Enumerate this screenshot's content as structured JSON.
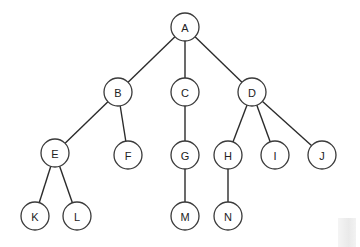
{
  "diagram": {
    "type": "tree",
    "root": "A",
    "nodes": [
      {
        "id": "A",
        "label": "A"
      },
      {
        "id": "B",
        "label": "B"
      },
      {
        "id": "C",
        "label": "C"
      },
      {
        "id": "D",
        "label": "D"
      },
      {
        "id": "E",
        "label": "E"
      },
      {
        "id": "F",
        "label": "F"
      },
      {
        "id": "G",
        "label": "G"
      },
      {
        "id": "H",
        "label": "H"
      },
      {
        "id": "I",
        "label": "I"
      },
      {
        "id": "J",
        "label": "J"
      },
      {
        "id": "K",
        "label": "K"
      },
      {
        "id": "L",
        "label": "L"
      },
      {
        "id": "M",
        "label": "M"
      },
      {
        "id": "N",
        "label": "N"
      }
    ],
    "edges": [
      [
        "A",
        "B"
      ],
      [
        "A",
        "C"
      ],
      [
        "A",
        "D"
      ],
      [
        "B",
        "E"
      ],
      [
        "B",
        "F"
      ],
      [
        "C",
        "G"
      ],
      [
        "D",
        "H"
      ],
      [
        "D",
        "I"
      ],
      [
        "D",
        "J"
      ],
      [
        "E",
        "K"
      ],
      [
        "E",
        "L"
      ],
      [
        "G",
        "M"
      ],
      [
        "H",
        "N"
      ]
    ]
  }
}
